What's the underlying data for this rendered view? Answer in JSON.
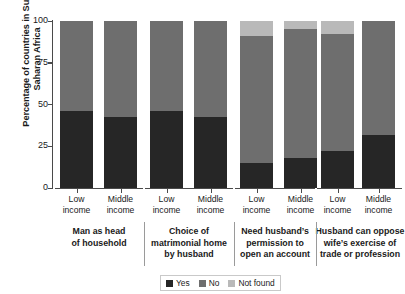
{
  "chart_data": {
    "type": "bar",
    "subtype": "stacked-bar-grouped",
    "title": "",
    "xlabel": "",
    "ylabel": "Percentage of countries in Sub-Saharan Africa",
    "ylim": [
      0,
      100
    ],
    "yticks": [
      0,
      25,
      50,
      75,
      100
    ],
    "ytick_labels": [
      "0",
      "25",
      "50",
      "75",
      "100"
    ],
    "grid": false,
    "legend_position": "bottom-right",
    "categories": [
      "Low income",
      "Middle income",
      "Low income",
      "Middle income",
      "Low income",
      "Middle income",
      "Low income",
      "Middle income"
    ],
    "groups": [
      {
        "label": "Man as head of household",
        "categories": [
          "Low income",
          "Middle income"
        ]
      },
      {
        "label": "Choice of matrimonial home by husband",
        "categories": [
          "Low income",
          "Middle income"
        ]
      },
      {
        "label": "Need husband’s permission to open an account",
        "categories": [
          "Low income",
          "Middle income"
        ]
      },
      {
        "label": "Husband can oppose wife’s exercise of trade or profession",
        "categories": [
          "Low income",
          "Middle income"
        ]
      }
    ],
    "series": [
      {
        "name": "Yes",
        "color": "#262626",
        "values": [
          46,
          42.5,
          46,
          42.5,
          15,
          18,
          22,
          32
        ]
      },
      {
        "name": "No",
        "color": "#6e6e6e",
        "values": [
          54,
          57.5,
          54,
          57.5,
          76,
          77,
          70,
          68
        ]
      },
      {
        "name": "Not found",
        "color": "#b9b9b9",
        "values": [
          0,
          0,
          0,
          0,
          9,
          5,
          8,
          0
        ]
      }
    ]
  },
  "axis": {
    "y_title": "Percentage of countries in Sub-Saharan Africa",
    "y_ticks": [
      "100",
      "75",
      "50",
      "25",
      "0"
    ]
  },
  "xlabels": [
    {
      "line1": "Low",
      "line2": "income"
    },
    {
      "line1": "Middle",
      "line2": "income"
    },
    {
      "line1": "Low",
      "line2": "income"
    },
    {
      "line1": "Middle",
      "line2": "income"
    },
    {
      "line1": "Low",
      "line2": "income"
    },
    {
      "line1": "Middle",
      "line2": "income"
    },
    {
      "line1": "Low",
      "line2": "income"
    },
    {
      "line1": "Middle",
      "line2": "income"
    }
  ],
  "groups": [
    {
      "line1": "Man as head",
      "line2": "of household",
      "line3": ""
    },
    {
      "line1": "Choice of",
      "line2": "matrimonial home",
      "line3": "by husband"
    },
    {
      "line1": "Need husband’s",
      "line2": "permission to",
      "line3": "open an account"
    },
    {
      "line1": "Husband can oppose",
      "line2": "wife’s exercise of",
      "line3": "trade or profession"
    }
  ],
  "legend": {
    "items": [
      {
        "label": "Yes",
        "color": "#262626"
      },
      {
        "label": "No",
        "color": "#6e6e6e"
      },
      {
        "label": "Not found",
        "color": "#b9b9b9"
      }
    ]
  }
}
